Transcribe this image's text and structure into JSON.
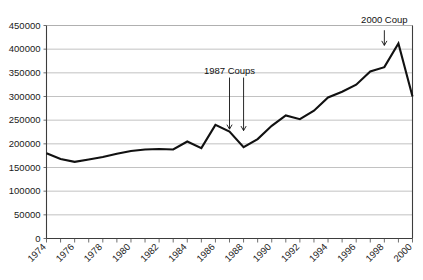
{
  "chart_data": {
    "type": "line",
    "title": "",
    "xlabel": "",
    "ylabel": "",
    "xlim": [
      1974,
      2000
    ],
    "ylim": [
      0,
      450000
    ],
    "grid": true,
    "legend": "none",
    "y_ticks": [
      0,
      50000,
      100000,
      150000,
      200000,
      250000,
      300000,
      350000,
      400000,
      450000
    ],
    "y_tick_labels": [
      "0",
      "50000",
      "100000",
      "150000",
      "200000",
      "250000",
      "300000",
      "350000",
      "400000",
      "450000"
    ],
    "x_ticks": [
      1974,
      1975,
      1976,
      1977,
      1978,
      1979,
      1980,
      1981,
      1982,
      1983,
      1984,
      1985,
      1986,
      1987,
      1988,
      1989,
      1990,
      1991,
      1992,
      1993,
      1994,
      1995,
      1996,
      1997,
      1998,
      1999,
      2000
    ],
    "x_tick_labels_shown": [
      "1974",
      "1976",
      "1978",
      "1980",
      "1982",
      "1984",
      "1986",
      "1988",
      "1990",
      "1992",
      "1994",
      "1996",
      "1998",
      "2000"
    ],
    "x": [
      1974,
      1975,
      1976,
      1977,
      1978,
      1979,
      1980,
      1981,
      1982,
      1983,
      1984,
      1985,
      1986,
      1987,
      1988,
      1989,
      1990,
      1991,
      1992,
      1993,
      1994,
      1995,
      1996,
      1997,
      1998,
      1999,
      2000
    ],
    "values": [
      180000,
      168000,
      162000,
      167000,
      172000,
      179000,
      185000,
      188000,
      189000,
      188000,
      205000,
      191000,
      240000,
      226000,
      193000,
      210000,
      238000,
      260000,
      252000,
      270000,
      298000,
      310000,
      325000,
      353000,
      362000,
      412000,
      300000
    ],
    "series": [
      {
        "name": "visitors",
        "values": [
          180000,
          168000,
          162000,
          167000,
          172000,
          179000,
          185000,
          188000,
          189000,
          188000,
          205000,
          191000,
          240000,
          226000,
          193000,
          210000,
          238000,
          260000,
          252000,
          270000,
          298000,
          310000,
          325000,
          353000,
          362000,
          412000,
          300000
        ]
      }
    ],
    "annotations": [
      {
        "id": "coups-1987",
        "label": "1987 Coups",
        "label_x": 1987,
        "label_y": 347000,
        "arrows": [
          {
            "x": 1987,
            "y_from": 340000,
            "y_to": 231000
          },
          {
            "x": 1988,
            "y_from": 340000,
            "y_to": 228000
          }
        ]
      },
      {
        "id": "coup-2000",
        "label": "2000 Coup",
        "label_x": 1998,
        "label_y": 455000,
        "arrows": [
          {
            "x": 1998,
            "y_from": 440000,
            "y_to": 408000
          }
        ]
      }
    ],
    "colors": {
      "line": "#111111",
      "grid": "#a8a8a8",
      "axis": "#3d3d3d",
      "text": "#1a1a1a",
      "background": "#ffffff"
    }
  }
}
